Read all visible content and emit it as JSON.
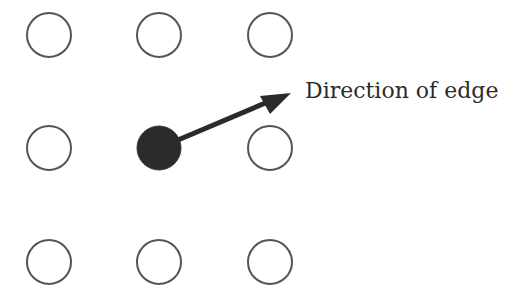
{
  "diagram": {
    "grid": {
      "rows": 3,
      "cols": 3,
      "centers_x": [
        49,
        159,
        270
      ],
      "centers_y": [
        35,
        148,
        262
      ],
      "radius": 22,
      "stroke_color": "#555555"
    },
    "active_node": {
      "row": 1,
      "col": 1,
      "fill_color": "#2b2b2b"
    },
    "arrow": {
      "from": [
        180,
        139
      ],
      "to": [
        291,
        93
      ],
      "color": "#2b2b2b"
    },
    "label": "Direction of edge"
  }
}
